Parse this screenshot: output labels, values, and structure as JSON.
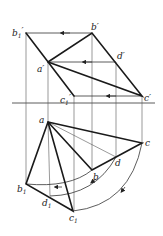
{
  "diagram": {
    "type": "descriptive-geometry-rotation",
    "labels": {
      "b1p": "b",
      "b1p_sub": "1",
      "b1p_prime": "′",
      "bp": "b′",
      "ap": "a′",
      "dp": "d′",
      "c1p": "c",
      "c1p_sub": "1",
      "c1p_prime": "′",
      "cp": "c′",
      "a": "a",
      "b": "b",
      "c": "c",
      "d": "d",
      "b1": "b",
      "b1_sub": "1",
      "d1": "d",
      "d1_sub": "1",
      "c1": "c",
      "c1_sub": "1"
    },
    "points": {
      "b1p": [
        26,
        33
      ],
      "bp": [
        92,
        33
      ],
      "ap": [
        48,
        62
      ],
      "dp": [
        116,
        62
      ],
      "c1p": [
        74,
        96
      ],
      "cp": [
        142,
        96
      ],
      "a": [
        48,
        122
      ],
      "b": [
        92,
        170
      ],
      "d": [
        116,
        157
      ],
      "c": [
        142,
        143
      ],
      "b1": [
        26,
        184
      ],
      "d1": [
        50,
        196
      ],
      "c1": [
        73,
        211
      ]
    },
    "axis_y": 103
  }
}
